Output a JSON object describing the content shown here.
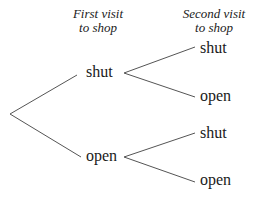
{
  "headers": {
    "first": {
      "line1": "First visit",
      "line2": "to shop"
    },
    "second": {
      "line1": "Second visit",
      "line2": "to shop"
    }
  },
  "tree": {
    "level1": [
      {
        "label": "shut",
        "children": [
          {
            "label": "shut"
          },
          {
            "label": "open"
          }
        ]
      },
      {
        "label": "open",
        "children": [
          {
            "label": "shut"
          },
          {
            "label": "open"
          }
        ]
      }
    ]
  },
  "colors": {
    "line": "#555555",
    "text": "#1a1a1a"
  }
}
